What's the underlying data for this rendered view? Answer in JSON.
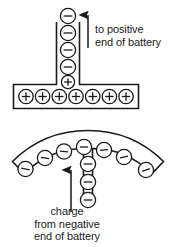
{
  "figure": {
    "colors": {
      "stroke": "#1a1a1a",
      "fill": "#ffffff",
      "text": "#1a1a1a",
      "background": "#ffffff"
    }
  },
  "top_figure": {
    "name": "t-shaped-conductor",
    "stem_charges": [
      {
        "sign": "−",
        "name": "minus-charge"
      },
      {
        "sign": "−",
        "name": "minus-charge"
      },
      {
        "sign": "−",
        "name": "minus-charge"
      },
      {
        "sign": "−",
        "name": "minus-charge"
      },
      {
        "sign": "+",
        "name": "plus-charge"
      }
    ],
    "bar_charges": [
      {
        "sign": "+"
      },
      {
        "sign": "+"
      },
      {
        "sign": "+"
      },
      {
        "sign": "+"
      },
      {
        "sign": "+"
      },
      {
        "sign": "+"
      },
      {
        "sign": "+"
      }
    ],
    "arrow": {
      "name": "up-arrow",
      "direction": "up"
    },
    "label": {
      "line1": "to positive",
      "line2": "end of battery"
    }
  },
  "bottom_figure": {
    "name": "curved-conductor",
    "arc_charges": [
      {
        "sign": "−"
      },
      {
        "sign": "−"
      },
      {
        "sign": "−"
      },
      {
        "sign": "−"
      },
      {
        "sign": "−"
      },
      {
        "sign": "−"
      },
      {
        "sign": "−"
      }
    ],
    "stem_charges": [
      {
        "sign": "−"
      },
      {
        "sign": "−"
      },
      {
        "sign": "−"
      }
    ],
    "arrow": {
      "name": "up-arrow",
      "direction": "up"
    },
    "label": {
      "line1": "charge",
      "line2": "from negative",
      "line3": "end of battery"
    }
  }
}
